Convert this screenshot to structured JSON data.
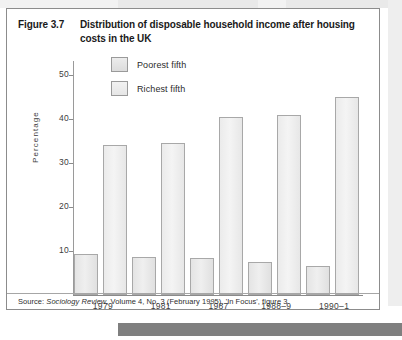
{
  "figure": {
    "number": "Figure 3.7",
    "title": "Distribution of disposable household income after housing costs in the UK",
    "source_prefix": "Source: ",
    "source_italic": "Sociology Review",
    "source_rest": ", Volume 4, No. 3 (February 1995), 'In Focus', figure 3"
  },
  "chart_data": {
    "type": "bar",
    "title": "Distribution of disposable household income after housing costs in the UK",
    "xlabel": "",
    "ylabel": "Percentage",
    "categories": [
      "1979",
      "1981",
      "1987",
      "1988–9",
      "1990–1"
    ],
    "series": [
      {
        "name": "Poorest fifth",
        "values": [
          9.3,
          8.6,
          8.3,
          7.4,
          6.6
        ]
      },
      {
        "name": "Richest fifth",
        "values": [
          34.0,
          34.5,
          40.5,
          41.0,
          45.0
        ]
      }
    ],
    "ylim": [
      0,
      52
    ],
    "yticks": [
      10,
      20,
      30,
      40,
      50
    ],
    "ytick_labels": [
      "10",
      "20",
      "30",
      "40",
      "50"
    ],
    "grid": false,
    "legend_position": "top-left-inside",
    "colors": {
      "bar_fill": "#ececec",
      "bar_border": "#a8a8a8",
      "axis": "#8a8a8a",
      "text": "#2b2b2b"
    }
  }
}
